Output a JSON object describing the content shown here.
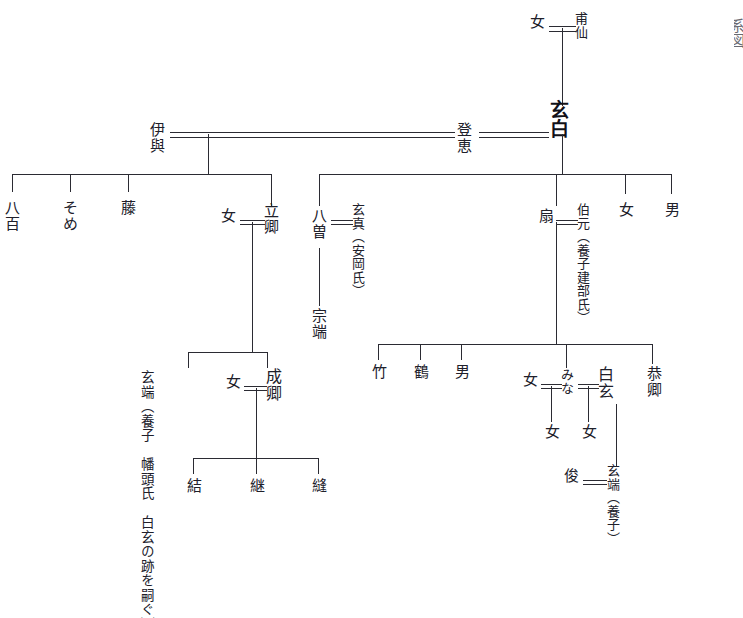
{
  "figure": {
    "title": "系図",
    "edge_caption": "系図"
  },
  "persons": {
    "onna_top": "女",
    "hosen": "甫仙",
    "genpaku": "玄白",
    "iyo": "伊與",
    "toe": "登恵",
    "yao": "八百",
    "some": "そめ",
    "fuji": "藤",
    "onna_ritsukyo": "女",
    "ritsukyo": "立卿",
    "yaso": "八曽",
    "genshin": "玄真（安岡氏）",
    "soutan": "宗端",
    "ougi": "扇",
    "hakugen_adopt": "伯元（養子建部氏）",
    "onna_r1": "女",
    "otoko_r1": "男",
    "gentan_note": "玄端（養子　幡頭氏　白玄の跡を嗣ぐ）",
    "onna_seikyo": "女",
    "seikyo": "成卿",
    "yui": "結",
    "tsugu": "継",
    "nui": "縫",
    "take": "竹",
    "tsuru": "鶴",
    "otoko_r2": "男",
    "onna_mina": "女",
    "mina": "みな",
    "hakugen": "白玄",
    "kyokyo": "恭卿",
    "onna_child1": "女",
    "onna_child2": "女",
    "shun": "俊",
    "gentan_adopt": "玄端（養子）"
  },
  "style": {
    "line_color": "#2b2b33",
    "text_color": "#20202a",
    "background": "#ffffff"
  }
}
